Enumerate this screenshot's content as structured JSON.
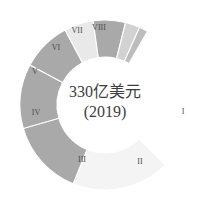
{
  "chart_data": {
    "type": "pie",
    "title": "",
    "subtitle": "",
    "center_total": "330亿美元",
    "center_year": "(2019)",
    "donut": true,
    "inner_radius": 48,
    "outer_radius": 85,
    "center_x": 105,
    "center_y": 105,
    "start_angle_deg": 315,
    "sweep_direction": "counterclockwise",
    "gap_deg": 45,
    "legend": "none",
    "grid": false,
    "categories": [
      "I",
      "II",
      "III",
      "IV",
      "V",
      "VI",
      "VII",
      "VIII"
    ],
    "values": [
      31.0,
      23.0,
      18.0,
      9.0,
      9.0,
      4.0,
      6.0,
      0.0
    ],
    "labels_inside": [
      "",
      "",
      "III",
      "IV",
      "V",
      "VI",
      "VII",
      ""
    ],
    "labels_outside": [
      "I",
      "II",
      "",
      "",
      "",
      "",
      "VIII",
      ""
    ],
    "colors": [
      "#f4f4f4",
      "#a9a9a9",
      "#a9a9a9",
      "#a9a9a9",
      "#e9e9e9",
      "#a9a9a9",
      "#d2d2d2",
      "#bdbdbd"
    ],
    "segments": [
      {
        "id": "I",
        "label": "I",
        "color": "#f4f4f4",
        "start_deg": 315.0,
        "end_deg": 248.0,
        "label_pos": "outside",
        "label_x": 183,
        "label_y": 112
      },
      {
        "id": "II",
        "label": "II",
        "color": "#a9a9a9",
        "start_deg": 248.0,
        "end_deg": 196.0,
        "label_pos": "outside",
        "label_x": 140,
        "label_y": 162
      },
      {
        "id": "III",
        "label": "III",
        "color": "#a9a9a9",
        "start_deg": 196.0,
        "end_deg": 152.0,
        "label_pos": "inside",
        "label_x": 82,
        "label_y": 160
      },
      {
        "id": "IV",
        "label": "IV",
        "color": "#a9a9a9",
        "start_deg": 152.0,
        "end_deg": 118.0,
        "label_pos": "inside",
        "label_x": 36,
        "label_y": 113
      },
      {
        "id": "V",
        "label": "V",
        "color": "#e9e9e9",
        "start_deg": 118.0,
        "end_deg": 98.0,
        "label_pos": "inside",
        "label_x": 35,
        "label_y": 72
      },
      {
        "id": "VI",
        "label": "VI",
        "color": "#a9a9a9",
        "start_deg": 98.0,
        "end_deg": 76.0,
        "label_pos": "inside",
        "label_x": 56,
        "label_y": 48
      },
      {
        "id": "VII",
        "label": "VII",
        "color": "#d2d2d2",
        "start_deg": 76.0,
        "end_deg": 66.0,
        "label_pos": "inside",
        "label_x": 77,
        "label_y": 31
      },
      {
        "id": "VIII",
        "label": "VIII",
        "color": "#bdbdbd",
        "start_deg": 66.0,
        "end_deg": 60.0,
        "label_pos": "outside",
        "label_x": 99,
        "label_y": 28
      }
    ],
    "xlabel": "",
    "ylabel": ""
  }
}
